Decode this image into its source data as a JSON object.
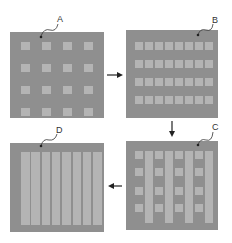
{
  "panels": [
    {
      "id": "A",
      "label": "A",
      "pattern": "sparse 4x4 dots"
    },
    {
      "id": "B",
      "label": "B",
      "pattern": "4 rows x 8 columns"
    },
    {
      "id": "C",
      "label": "C",
      "pattern": "alternating columns with stripes"
    },
    {
      "id": "D",
      "label": "D",
      "pattern": "full 8 column grid"
    }
  ],
  "colors": {
    "panel": "#8f8f8f",
    "cell": "#b4b4b4",
    "arrow": "#222222"
  }
}
